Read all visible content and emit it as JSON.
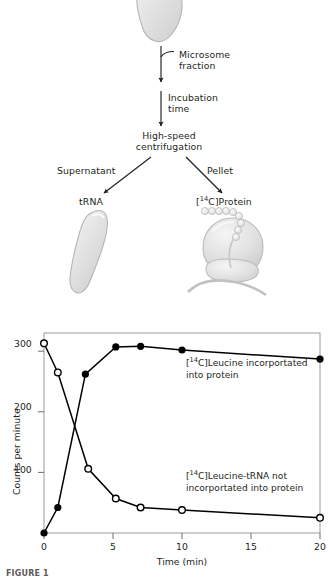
{
  "figure": {
    "caption_partial": "FIGURE 1"
  },
  "schematic": {
    "labels": {
      "microsome_fraction": "Microsome\nfraction",
      "incubation_time": "Incubation\ntime",
      "high_speed_centrifugation": "High-speed\ncentrifugation",
      "supernatant": "Supernatant",
      "pellet": "Pellet",
      "trna": "tRNA",
      "protein_prefix": "[",
      "protein_isotope": "14",
      "protein_suffix": "C]Protein"
    }
  },
  "chart_data": {
    "type": "line",
    "title": "",
    "xlabel": "Time (min)",
    "ylabel": "Counts per minute",
    "xlim": [
      0,
      20
    ],
    "ylim": [
      0,
      330
    ],
    "xticks": [
      0,
      5,
      10,
      15,
      20
    ],
    "xticklabels": [
      "0",
      "5",
      "10",
      "15",
      "20"
    ],
    "yticks": [
      100,
      200,
      300
    ],
    "yticklabels": [
      "100",
      "200",
      "300"
    ],
    "grid": false,
    "legend_position": "inline-annotations",
    "series": [
      {
        "name": "[14C]Leucine incorportated into protein",
        "label_line1_prefix": "[",
        "label_line1_isotope": "14",
        "label_line1_rest": "C]Leucine incorportated",
        "label_line2": "into protein",
        "marker": "filled-circle",
        "color": "#000000",
        "x": [
          0,
          1,
          3,
          5.2,
          7,
          10,
          20
        ],
        "y": [
          0,
          42,
          262,
          307,
          308,
          302,
          287
        ]
      },
      {
        "name": "[14C]Leucine-tRNA not incorportated into protein",
        "label_line1_prefix": "[",
        "label_line1_isotope": "14",
        "label_line1_rest": "C]Leucine-tRNA not",
        "label_line2": "incorportated into protein",
        "marker": "open-circle",
        "color": "#000000",
        "x": [
          0,
          1,
          3.2,
          5.2,
          7,
          10,
          20
        ],
        "y": [
          313,
          265,
          106,
          57,
          42,
          38,
          25
        ]
      }
    ]
  },
  "colors": {
    "ink": "#231f20",
    "axis": "#8d8d8d",
    "shape_fill": "#e3e3e3",
    "shape_stroke": "#b9b9b9"
  }
}
